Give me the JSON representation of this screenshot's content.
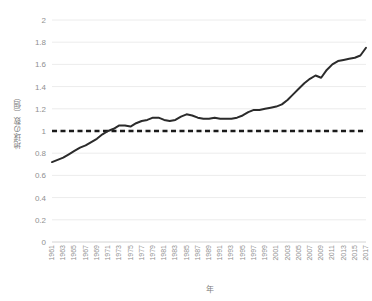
{
  "chart_data": {
    "type": "line",
    "title": "",
    "xlabel": "年",
    "ylabel": "地球の数（個）",
    "ylim": [
      0,
      2
    ],
    "xlim": [
      1961,
      2017
    ],
    "grid": true,
    "legend": "none",
    "y_ticks": [
      "0",
      "0.2",
      "0.4",
      "0.6",
      "0.8",
      "1",
      "1.2",
      "1.4",
      "1.6",
      "1.8",
      "2"
    ],
    "y_tick_values": [
      0,
      0.2,
      0.4,
      0.6,
      0.8,
      1,
      1.2,
      1.4,
      1.6,
      1.8,
      2
    ],
    "x_tick_labels": [
      "1961",
      "1963",
      "1965",
      "1967",
      "1969",
      "1971",
      "1973",
      "1975",
      "1977",
      "1979",
      "1981",
      "1983",
      "1985",
      "1987",
      "1989",
      "1991",
      "1993",
      "1995",
      "1997",
      "1999",
      "2001",
      "2003",
      "2005",
      "2007",
      "2009",
      "2011",
      "2013",
      "2015",
      "2017"
    ],
    "x": [
      1961,
      1962,
      1963,
      1964,
      1965,
      1966,
      1967,
      1968,
      1969,
      1970,
      1971,
      1972,
      1973,
      1974,
      1975,
      1976,
      1977,
      1978,
      1979,
      1980,
      1981,
      1982,
      1983,
      1984,
      1985,
      1986,
      1987,
      1988,
      1989,
      1990,
      1991,
      1992,
      1993,
      1994,
      1995,
      1996,
      1997,
      1998,
      1999,
      2000,
      2001,
      2002,
      2003,
      2004,
      2005,
      2006,
      2007,
      2008,
      2009,
      2010,
      2011,
      2012,
      2013,
      2014,
      2015,
      2016,
      2017
    ],
    "series": [
      {
        "name": "地球の数（個）",
        "color": "#2b2b2b",
        "style": "solid",
        "width": 2,
        "values": [
          0.72,
          0.74,
          0.76,
          0.79,
          0.82,
          0.85,
          0.87,
          0.9,
          0.93,
          0.97,
          1.0,
          1.02,
          1.05,
          1.05,
          1.04,
          1.07,
          1.09,
          1.1,
          1.12,
          1.12,
          1.1,
          1.09,
          1.1,
          1.13,
          1.15,
          1.14,
          1.12,
          1.11,
          1.11,
          1.12,
          1.11,
          1.11,
          1.11,
          1.12,
          1.14,
          1.17,
          1.19,
          1.19,
          1.2,
          1.21,
          1.22,
          1.24,
          1.28,
          1.33,
          1.38,
          1.43,
          1.47,
          1.5,
          1.48,
          1.55,
          1.6,
          1.63,
          1.64,
          1.65,
          1.66,
          1.68,
          1.75
        ]
      },
      {
        "name": "1つの地球",
        "color": "#1a1a1a",
        "style": "dashed",
        "width": 2.5,
        "constant": 1.0
      }
    ]
  }
}
